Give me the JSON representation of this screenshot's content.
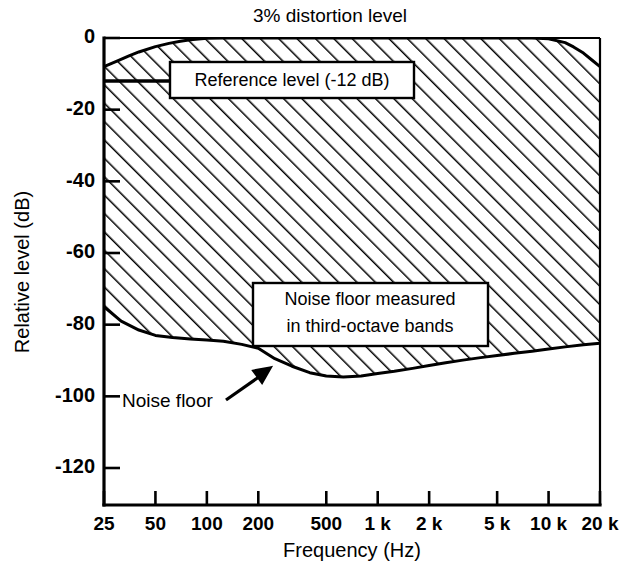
{
  "chart_data": {
    "type": "area",
    "title": "3% distortion level",
    "xlabel": "Frequency (Hz)",
    "ylabel": "Relative level (dB)",
    "xscale": "log",
    "xlim": [
      25,
      20000
    ],
    "ylim": [
      -130,
      2
    ],
    "grid": false,
    "legend": null,
    "xticks": [
      {
        "value": 25,
        "label": "25"
      },
      {
        "value": 50,
        "label": "50"
      },
      {
        "value": 100,
        "label": "100"
      },
      {
        "value": 200,
        "label": "200"
      },
      {
        "value": 500,
        "label": "500"
      },
      {
        "value": 1000,
        "label": "1 k"
      },
      {
        "value": 2000,
        "label": "2 k"
      },
      {
        "value": 5000,
        "label": "5 k"
      },
      {
        "value": 10000,
        "label": "10 k"
      },
      {
        "value": 20000,
        "label": "20 k"
      }
    ],
    "yticks": [
      {
        "value": 0,
        "label": "0"
      },
      {
        "value": -20,
        "label": "-20"
      },
      {
        "value": -40,
        "label": "-40"
      },
      {
        "value": -60,
        "label": "-60"
      },
      {
        "value": -80,
        "label": "-80"
      },
      {
        "value": -100,
        "label": "-100"
      },
      {
        "value": -120,
        "label": "-120"
      }
    ],
    "series": [
      {
        "name": "3% distortion level",
        "role": "upper-boundary",
        "x": [
          25,
          30,
          35,
          40,
          50,
          60,
          70,
          80,
          100,
          125,
          160,
          200,
          250,
          315,
          400,
          500,
          630,
          800,
          1000,
          1250,
          1600,
          2000,
          2500,
          3150,
          4000,
          5000,
          6300,
          8000,
          10000,
          12500,
          14000,
          16000,
          18000,
          20000
        ],
        "y": [
          -8.0,
          -6.4,
          -5.0,
          -3.9,
          -2.4,
          -1.5,
          -0.9,
          -0.5,
          -0.1,
          0.0,
          0.0,
          0.0,
          0.0,
          0.0,
          0.0,
          0.0,
          0.0,
          0.0,
          0.0,
          0.0,
          0.0,
          0.0,
          0.0,
          0.0,
          0.0,
          0.0,
          0.0,
          0.0,
          -0.2,
          -1.3,
          -2.5,
          -4.2,
          -6.2,
          -8.0
        ]
      },
      {
        "name": "Noise floor measured in third-octave bands",
        "role": "lower-boundary",
        "x": [
          25,
          31.5,
          40,
          50,
          63,
          80,
          100,
          125,
          160,
          200,
          250,
          315,
          400,
          500,
          630,
          800,
          1000,
          1250,
          1600,
          2000,
          2500,
          3150,
          4000,
          5000,
          6300,
          8000,
          10000,
          12500,
          16000,
          20000
        ],
        "y": [
          -75.0,
          -79.0,
          -81.5,
          -83.0,
          -83.6,
          -84.0,
          -84.3,
          -84.6,
          -85.5,
          -86.6,
          -89.5,
          -91.6,
          -93.4,
          -94.3,
          -94.6,
          -94.3,
          -93.6,
          -93.0,
          -92.2,
          -91.4,
          -90.6,
          -89.9,
          -89.2,
          -88.6,
          -88.0,
          -87.4,
          -86.8,
          -86.2,
          -85.6,
          -85.2
        ]
      },
      {
        "name": "Reference level",
        "role": "horizontal-marker",
        "value": -12,
        "x_start": 25,
        "x_end": 190
      }
    ],
    "annotations": [
      {
        "id": "reference-level-callout",
        "text": "Reference level (-12 dB)",
        "boxed": true
      },
      {
        "id": "noise-floor-band-callout",
        "text_lines": [
          "Noise floor measured",
          "in third-octave bands"
        ],
        "boxed": true
      },
      {
        "id": "noise-floor-pointer",
        "text": "Noise floor",
        "boxed": false,
        "arrow": true
      }
    ]
  },
  "figure": {
    "title": "3% distortion level",
    "x_axis_title": "Frequency (Hz)",
    "y_axis_title": "Relative level (dB)"
  },
  "callouts": {
    "reference_level": "Reference level (-12 dB)",
    "noise_floor_band_line1": "Noise floor measured",
    "noise_floor_band_line2": "in third-octave bands",
    "noise_floor_pointer": "Noise floor"
  },
  "colors": {
    "ink": "#000000",
    "paper": "#ffffff"
  }
}
